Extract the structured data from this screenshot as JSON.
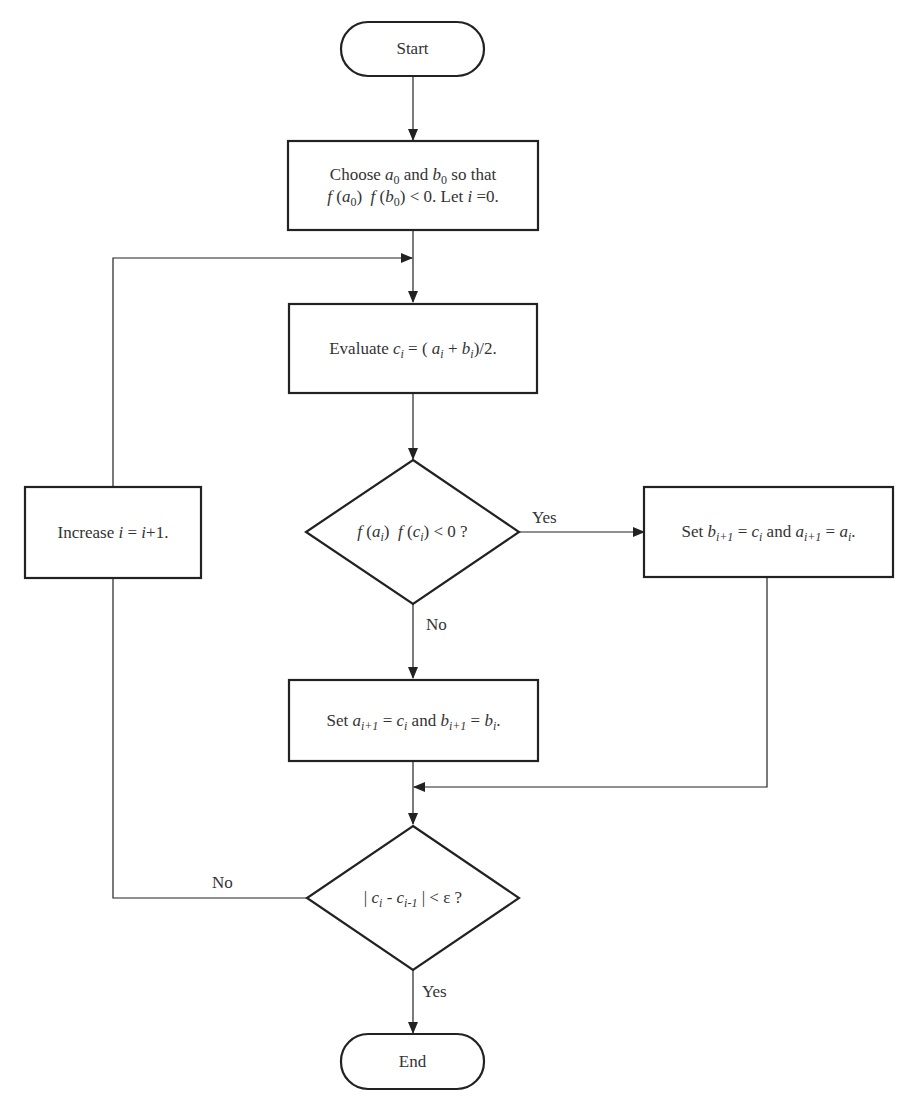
{
  "diagram": {
    "type": "flowchart",
    "nodes": {
      "start": {
        "shape": "terminator",
        "label": "Start"
      },
      "init": {
        "shape": "process",
        "line1": {
          "pre": "Choose ",
          "a": "a",
          "a_sub": "0",
          "mid": " and ",
          "b": "b",
          "b_sub": "0",
          "post": " so that"
        },
        "line2": {
          "f1": "f",
          "arg1": "a",
          "arg1_sub": "0",
          "f2": "f",
          "arg2": "b",
          "arg2_sub": "0",
          "cond": "< 0. Let ",
          "var": "i",
          "assign": " =0."
        }
      },
      "evaluate": {
        "shape": "process",
        "pre": "Evaluate ",
        "c": "c",
        "c_sub": "i",
        "eq": " = ( ",
        "a": "a",
        "a_sub": "i",
        "plus": " + ",
        "b": "b",
        "b_sub": "i",
        "post": ")/2."
      },
      "check_sign": {
        "shape": "decision",
        "f1": "f",
        "arg1": "a",
        "arg1_sub": "i",
        "f2": "f",
        "arg2": "c",
        "arg2_sub": "i",
        "post": " < 0 ?"
      },
      "set_b": {
        "shape": "process",
        "pre": "Set ",
        "v1": "b",
        "v1_sub": "i+1",
        "eq1": " = ",
        "r1": "c",
        "r1_sub": "i",
        "and": " and ",
        "v2": "a",
        "v2_sub": "i+1",
        "eq2": " = ",
        "r2": "a",
        "r2_sub": "i",
        "post": "."
      },
      "set_a": {
        "shape": "process",
        "pre": "Set ",
        "v1": "a",
        "v1_sub": "i+1",
        "eq1": " = ",
        "r1": "c",
        "r1_sub": "i",
        "and": " and ",
        "v2": "b",
        "v2_sub": "i+1",
        "eq2": " = ",
        "r2": "b",
        "r2_sub": "i",
        "post": "."
      },
      "increase": {
        "shape": "process",
        "pre": "Increase ",
        "var": "i",
        "eq": " = ",
        "var2": "i",
        "post": "+1."
      },
      "check_conv": {
        "shape": "decision",
        "bar1": "| ",
        "c1": "c",
        "c1_sub": "i",
        "minus": " - ",
        "c2": "c",
        "c2_sub": "i-1",
        "bar2": " |",
        "post": " < ε ?"
      },
      "end": {
        "shape": "terminator",
        "label": "End"
      }
    },
    "edges": [
      {
        "from": "start",
        "to": "init",
        "label": ""
      },
      {
        "from": "init",
        "to": "evaluate",
        "label": ""
      },
      {
        "from": "evaluate",
        "to": "check_sign",
        "label": ""
      },
      {
        "from": "check_sign",
        "to": "set_b",
        "label": "Yes"
      },
      {
        "from": "check_sign",
        "to": "set_a",
        "label": "No"
      },
      {
        "from": "set_b",
        "to": "check_conv",
        "label": ""
      },
      {
        "from": "set_a",
        "to": "check_conv",
        "label": ""
      },
      {
        "from": "check_conv",
        "to": "increase",
        "label": "No"
      },
      {
        "from": "increase",
        "to": "evaluate",
        "label": ""
      },
      {
        "from": "check_conv",
        "to": "end",
        "label": "Yes"
      }
    ],
    "edge_labels": {
      "sign_yes": "Yes",
      "sign_no": "No",
      "conv_no": "No",
      "conv_yes": "Yes"
    },
    "colors": {
      "stroke": "#222222",
      "text": "#333333",
      "background": "#ffffff"
    }
  }
}
